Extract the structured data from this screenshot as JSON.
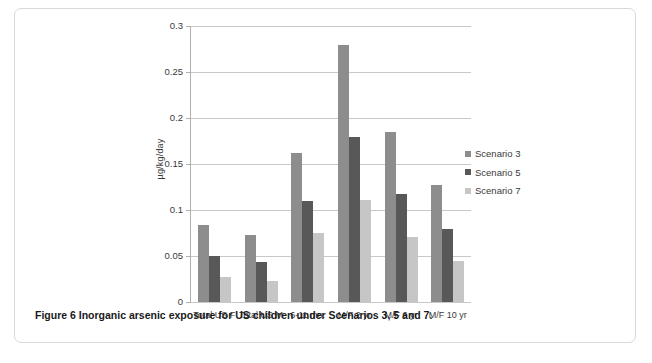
{
  "figure": {
    "caption_label": "Figure 6",
    "caption_text": "Inorganic arsenic exposure for US children under Scenarios 3, 5 and 7."
  },
  "legend": {
    "position": "right",
    "items": [
      {
        "label": "Scenario 3",
        "color": "#8d8d8d"
      },
      {
        "label": "Scenario 5",
        "color": "#585858"
      },
      {
        "label": "Scenario 7",
        "color": "#c6c6c6"
      }
    ]
  },
  "chart_data": {
    "type": "bar",
    "title": "",
    "xlabel": "",
    "ylabel": "µg/kg/day",
    "ylim": [
      0,
      0.3
    ],
    "ytick_labels": [
      "0",
      "0.05",
      "0.1",
      "0.15",
      "0.2",
      "0.25",
      "0.3"
    ],
    "yticks": [
      0,
      0.05,
      0.1,
      0.15,
      0.2,
      0.25,
      0.3
    ],
    "grid": true,
    "categories": [
      "Total US F",
      "Total US M",
      "6-11 mo.",
      "M/F 2 yr",
      "M/F 6 yr",
      "M/F 10 yr"
    ],
    "series": [
      {
        "name": "Scenario 3",
        "color": "#8d8d8d",
        "values": [
          0.084,
          0.073,
          0.162,
          0.279,
          0.185,
          0.127
        ]
      },
      {
        "name": "Scenario 5",
        "color": "#585858",
        "values": [
          0.05,
          0.044,
          0.11,
          0.179,
          0.117,
          0.079
        ]
      },
      {
        "name": "Scenario 7",
        "color": "#c6c6c6",
        "values": [
          0.027,
          0.023,
          0.075,
          0.111,
          0.071,
          0.045
        ]
      }
    ]
  }
}
